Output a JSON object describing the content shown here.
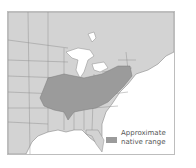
{
  "map": {
    "title": "",
    "colors": {
      "land": "#d3d3d3",
      "range": "#9b9b9b",
      "water": "#ffffff",
      "borders": "#8a8a8a"
    },
    "region": "Eastern United States",
    "legend": {
      "line1": "Approximate",
      "line2": "native range"
    }
  }
}
